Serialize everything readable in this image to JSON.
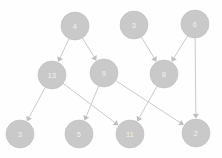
{
  "graph": {
    "type": "directed-graph",
    "background_color": "#fefefe",
    "node_fill_color": "#c9c9c9",
    "node_label_color": "#f2f2f2",
    "edge_color": "#c4c4c4",
    "node_radius": 14,
    "nodes": [
      {
        "id": "n4",
        "label": "4",
        "cx": 75,
        "cy": 26
      },
      {
        "id": "n3t",
        "label": "3",
        "cx": 134,
        "cy": 25
      },
      {
        "id": "n6",
        "label": "6",
        "cx": 195,
        "cy": 24
      },
      {
        "id": "n13",
        "label": "13",
        "cx": 52,
        "cy": 75
      },
      {
        "id": "n9",
        "label": "9",
        "cx": 104,
        "cy": 73
      },
      {
        "id": "n8",
        "label": "8",
        "cx": 164,
        "cy": 74
      },
      {
        "id": "n3b",
        "label": "3",
        "cx": 20,
        "cy": 134
      },
      {
        "id": "n5",
        "label": "5",
        "cx": 79,
        "cy": 134
      },
      {
        "id": "n11",
        "label": "11",
        "cx": 130,
        "cy": 134
      },
      {
        "id": "n2",
        "label": "2",
        "cx": 196,
        "cy": 133
      }
    ],
    "edges": [
      {
        "from": "n4",
        "to": "n13"
      },
      {
        "from": "n4",
        "to": "n9"
      },
      {
        "from": "n3t",
        "to": "n8"
      },
      {
        "from": "n6",
        "to": "n8"
      },
      {
        "from": "n6",
        "to": "n2"
      },
      {
        "from": "n13",
        "to": "n3b"
      },
      {
        "from": "n13",
        "to": "n11"
      },
      {
        "from": "n9",
        "to": "n5"
      },
      {
        "from": "n9",
        "to": "n2"
      },
      {
        "from": "n8",
        "to": "n11"
      }
    ]
  }
}
